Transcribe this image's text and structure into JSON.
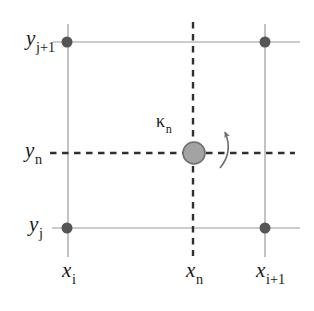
{
  "figure": {
    "labels": {
      "y_j_plus_1": {
        "base": "y",
        "sub": "j+1"
      },
      "y_n": {
        "base": "y",
        "sub": "n"
      },
      "y_j": {
        "base": "y",
        "sub": "j"
      },
      "x_i": {
        "base": "x",
        "sub": "i"
      },
      "x_n": {
        "base": "x",
        "sub": "n"
      },
      "x_i_plus_1": {
        "base": "x",
        "sub": "i+1"
      },
      "kappa_n": {
        "base": "κ",
        "sub": "n"
      }
    },
    "icons": {
      "rotation_arrow": "counterclockwise-rotation-arrow"
    },
    "colors": {
      "background": "#ffffff",
      "grid_line": "#9a9a9a",
      "dashed_line": "#2f2f2f",
      "corner_dot": "#555555",
      "center_node_fill": "#a3a3a3",
      "center_node_stroke": "#707070",
      "arrow": "#6e6e6e",
      "text": "#1a1a1a"
    }
  }
}
